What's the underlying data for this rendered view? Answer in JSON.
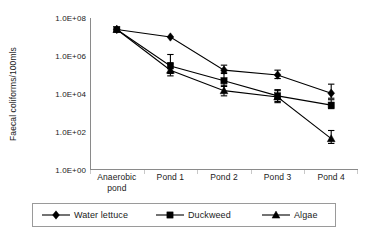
{
  "chart_data": {
    "type": "line",
    "title": "",
    "xlabel": "",
    "ylabel": "Faecal coliforms/100mls",
    "categories": [
      "Anaerobic pond",
      "Pond 1",
      "Pond 2",
      "Pond 3",
      "Pond 4"
    ],
    "yscale": "log",
    "ylim": [
      1,
      100000000
    ],
    "yticks": [
      1,
      100,
      10000,
      1000000,
      100000000
    ],
    "ytick_labels": [
      "1.0E+00",
      "1.0E+02",
      "1.0E+04",
      "1.0E+06",
      "1.0E+08"
    ],
    "grid": false,
    "legend_position": "bottom",
    "error_bars": true,
    "series": [
      {
        "name": "Water lettuce",
        "marker": "diamond",
        "values": [
          25000000,
          10000000,
          180000,
          100000,
          11000
        ],
        "err_low": [
          0,
          0,
          60000,
          35000,
          5000
        ],
        "err_high": [
          0,
          0,
          150000,
          80000,
          22000
        ]
      },
      {
        "name": "Duckweed",
        "marker": "square",
        "values": [
          25000000,
          300000,
          50000,
          8000,
          2600
        ],
        "err_low": [
          0,
          180000,
          25000,
          4000,
          900
        ],
        "err_high": [
          0,
          900000,
          90000,
          9000,
          2400
        ]
      },
      {
        "name": "Algae",
        "marker": "triangle",
        "values": [
          25000000,
          180000,
          15000,
          7000,
          45
        ],
        "err_low": [
          0,
          90000,
          7000,
          3500,
          20
        ],
        "err_high": [
          0,
          260000,
          14000,
          8000,
          75
        ]
      }
    ]
  },
  "legend": {
    "items": [
      {
        "label": "Water lettuce",
        "marker": "diamond"
      },
      {
        "label": "Duckweed",
        "marker": "square"
      },
      {
        "label": "Algae",
        "marker": "triangle"
      }
    ]
  }
}
